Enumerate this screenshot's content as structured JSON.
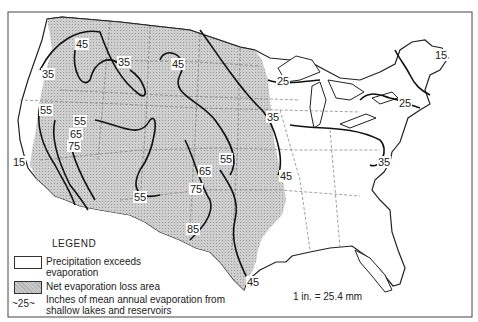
{
  "map": {
    "subject": "Mean annual evaporation from shallow lakes and reservoirs, conterminous United States",
    "colors": {
      "net_loss_fill": "#c9c9c9",
      "precip_exceeds_fill": "#ffffff",
      "contour": "#111111",
      "state_boundary": "#777777"
    },
    "contour_labels": [
      {
        "value": "45",
        "x": 82,
        "y": 44
      },
      {
        "value": "35",
        "x": 124,
        "y": 62
      },
      {
        "value": "45",
        "x": 178,
        "y": 64
      },
      {
        "value": "35",
        "x": 48,
        "y": 74
      },
      {
        "value": "25",
        "x": 283,
        "y": 81
      },
      {
        "value": "15",
        "x": 441,
        "y": 55
      },
      {
        "value": "25",
        "x": 405,
        "y": 103
      },
      {
        "value": "55",
        "x": 46,
        "y": 110
      },
      {
        "value": "55",
        "x": 80,
        "y": 121
      },
      {
        "value": "35",
        "x": 273,
        "y": 117
      },
      {
        "value": "65",
        "x": 76,
        "y": 134
      },
      {
        "value": "75",
        "x": 74,
        "y": 146
      },
      {
        "value": "15",
        "x": 19,
        "y": 162
      },
      {
        "value": "55",
        "x": 226,
        "y": 159
      },
      {
        "value": "35",
        "x": 384,
        "y": 162
      },
      {
        "value": "65",
        "x": 205,
        "y": 171
      },
      {
        "value": "45",
        "x": 286,
        "y": 176
      },
      {
        "value": "75",
        "x": 196,
        "y": 189
      },
      {
        "value": "55",
        "x": 140,
        "y": 197
      },
      {
        "value": "85",
        "x": 193,
        "y": 229
      },
      {
        "value": "45",
        "x": 253,
        "y": 282
      }
    ]
  },
  "legend": {
    "title": "LEGEND",
    "items": [
      {
        "swatch": "white",
        "label": "Precipitation exceeds evaporation"
      },
      {
        "swatch": "gray",
        "label": "Net evaporation loss area"
      },
      {
        "swatch": "contour",
        "symbol": "~25~",
        "label": "Inches of mean annual evaporation from shallow lakes and reservoirs"
      }
    ]
  },
  "scale_note": "1 in. = 25.4 mm"
}
